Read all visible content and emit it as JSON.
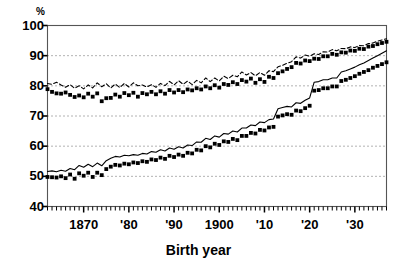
{
  "chart_data": {
    "type": "line",
    "title": "",
    "xlabel": "Birth year",
    "ylabel": "%",
    "ylim": [
      40,
      100
    ],
    "xlim": [
      1862,
      1937
    ],
    "grid": true,
    "legend": "none",
    "y_ticks": [
      100,
      90,
      80,
      70,
      60,
      50,
      40
    ],
    "y_tick_labels": [
      "100",
      "90",
      "80",
      "70",
      "60",
      "50",
      "40"
    ],
    "x_ticks": [
      1870,
      1880,
      1890,
      1900,
      1910,
      1920,
      1930
    ],
    "x_tick_labels": [
      "1870",
      "'80",
      "'90",
      "1900",
      "'10",
      "'20",
      "'30"
    ],
    "x_minor_tick_interval": 1,
    "series": [
      {
        "name": "upper-dashed-line",
        "style": "dashed",
        "color": "#000000",
        "x": [
          1862,
          1863,
          1864,
          1865,
          1866,
          1867,
          1868,
          1869,
          1870,
          1871,
          1872,
          1873,
          1874,
          1875,
          1876,
          1877,
          1878,
          1879,
          1880,
          1881,
          1882,
          1883,
          1884,
          1885,
          1886,
          1887,
          1888,
          1889,
          1890,
          1891,
          1892,
          1893,
          1894,
          1895,
          1896,
          1897,
          1898,
          1899,
          1900,
          1901,
          1902,
          1903,
          1904,
          1905,
          1906,
          1907,
          1908,
          1909,
          1910,
          1911,
          1912,
          1913,
          1914,
          1915,
          1916,
          1917,
          1918,
          1919,
          1920,
          1921,
          1922,
          1923,
          1924,
          1925,
          1926,
          1927,
          1928,
          1929,
          1930,
          1931,
          1932,
          1933,
          1934,
          1935,
          1936,
          1937
        ],
        "values": [
          80.8,
          80.5,
          81.2,
          80.3,
          79.5,
          80.4,
          79.2,
          80.0,
          79.0,
          80.3,
          79.3,
          81.0,
          79.7,
          80.7,
          79.3,
          80.6,
          79.4,
          80.8,
          79.6,
          81.0,
          80.0,
          80.3,
          79.6,
          80.4,
          79.5,
          80.8,
          80.1,
          81.5,
          80.3,
          81.7,
          80.5,
          81.6,
          80.4,
          81.8,
          81.0,
          82.6,
          81.4,
          82.6,
          81.6,
          83.2,
          82.4,
          83.5,
          83.0,
          84.6,
          83.6,
          84.4,
          83.3,
          84.4,
          83.5,
          85.0,
          84.7,
          86.3,
          86.8,
          87.5,
          88.0,
          89.6,
          89.2,
          90.2,
          89.8,
          90.6,
          90.4,
          91.3,
          91.2,
          92.0,
          91.6,
          92.4,
          92.3,
          92.9,
          92.7,
          93.4,
          93.3,
          94.0,
          94.2,
          94.8,
          95.2,
          95.6
        ]
      },
      {
        "name": "upper-square-markers",
        "style": "markers-squares",
        "color": "#000000",
        "x": [
          1862,
          1863,
          1864,
          1865,
          1866,
          1867,
          1868,
          1869,
          1870,
          1871,
          1872,
          1873,
          1874,
          1875,
          1876,
          1877,
          1878,
          1879,
          1880,
          1881,
          1882,
          1883,
          1884,
          1885,
          1886,
          1887,
          1888,
          1889,
          1890,
          1891,
          1892,
          1893,
          1894,
          1895,
          1896,
          1897,
          1898,
          1899,
          1900,
          1901,
          1902,
          1903,
          1904,
          1905,
          1906,
          1907,
          1908,
          1909,
          1910,
          1911,
          1912,
          1913,
          1914,
          1915,
          1916,
          1917,
          1918,
          1919,
          1920,
          1921,
          1922,
          1923,
          1924,
          1925,
          1926,
          1927,
          1928,
          1929,
          1930,
          1931,
          1932,
          1933,
          1934,
          1935,
          1936,
          1937
        ],
        "values": [
          78.9,
          78.0,
          77.5,
          77.4,
          77.8,
          77.0,
          76.3,
          76.8,
          76.2,
          77.4,
          76.4,
          77.5,
          74.9,
          75.9,
          76.0,
          77.1,
          76.4,
          77.6,
          76.9,
          77.7,
          76.4,
          77.6,
          77.2,
          78.0,
          77.2,
          78.2,
          77.4,
          78.6,
          77.8,
          78.6,
          77.9,
          78.8,
          78.5,
          79.2,
          78.8,
          79.8,
          79.2,
          80.2,
          79.4,
          80.6,
          80.3,
          81.2,
          80.6,
          81.9,
          81.4,
          82.4,
          81.0,
          82.2,
          81.3,
          83.0,
          82.6,
          84.2,
          84.8,
          85.6,
          86.2,
          87.6,
          87.4,
          88.4,
          88.2,
          89.0,
          88.9,
          89.8,
          89.8,
          90.6,
          90.3,
          91.1,
          91.0,
          91.7,
          91.6,
          92.3,
          92.2,
          93.0,
          93.2,
          93.8,
          94.2,
          94.6
        ]
      },
      {
        "name": "lower-solid-line",
        "style": "solid",
        "color": "#000000",
        "x": [
          1862,
          1863,
          1864,
          1865,
          1866,
          1867,
          1868,
          1869,
          1870,
          1871,
          1872,
          1873,
          1874,
          1875,
          1876,
          1877,
          1878,
          1879,
          1880,
          1881,
          1882,
          1883,
          1884,
          1885,
          1886,
          1887,
          1888,
          1889,
          1890,
          1891,
          1892,
          1893,
          1894,
          1895,
          1896,
          1897,
          1898,
          1899,
          1900,
          1901,
          1902,
          1903,
          1904,
          1905,
          1906,
          1907,
          1908,
          1909,
          1910,
          1911,
          1912,
          1913,
          1914,
          1915,
          1916,
          1917,
          1918,
          1919,
          1920,
          1921,
          1922,
          1923,
          1924,
          1925,
          1926,
          1927,
          1928,
          1929,
          1930,
          1931,
          1932,
          1933,
          1934,
          1935,
          1936,
          1937
        ],
        "values": [
          51.6,
          51.8,
          51.5,
          52.0,
          51.7,
          52.6,
          52.2,
          53.6,
          53.0,
          54.0,
          53.2,
          54.4,
          53.5,
          55.2,
          56.0,
          56.6,
          56.4,
          57.0,
          56.8,
          57.2,
          57.0,
          57.6,
          57.4,
          58.2,
          58.0,
          58.8,
          58.4,
          59.4,
          59.0,
          59.8,
          59.4,
          60.4,
          60.2,
          61.4,
          61.3,
          62.6,
          62.2,
          63.4,
          63.0,
          64.2,
          64.0,
          65.0,
          64.7,
          66.0,
          66.0,
          67.0,
          66.8,
          68.0,
          67.8,
          68.8,
          69.0,
          72.4,
          72.8,
          73.2,
          73.0,
          74.4,
          74.2,
          75.2,
          76.0,
          81.2,
          81.4,
          82.0,
          82.0,
          82.6,
          82.6,
          84.6,
          85.0,
          85.6,
          86.2,
          87.0,
          87.6,
          88.4,
          89.2,
          90.0,
          90.8,
          91.6
        ]
      },
      {
        "name": "lower-square-markers",
        "style": "markers-squares",
        "color": "#000000",
        "x": [
          1862,
          1863,
          1864,
          1865,
          1866,
          1867,
          1868,
          1869,
          1870,
          1871,
          1872,
          1873,
          1874,
          1875,
          1876,
          1877,
          1878,
          1879,
          1880,
          1881,
          1882,
          1883,
          1884,
          1885,
          1886,
          1887,
          1888,
          1889,
          1890,
          1891,
          1892,
          1893,
          1894,
          1895,
          1896,
          1897,
          1898,
          1899,
          1900,
          1901,
          1902,
          1903,
          1904,
          1905,
          1906,
          1907,
          1908,
          1909,
          1910,
          1911,
          1912,
          1913,
          1914,
          1915,
          1916,
          1917,
          1918,
          1919,
          1920,
          1921,
          1922,
          1923,
          1924,
          1925,
          1926,
          1927,
          1928,
          1929,
          1930,
          1931,
          1932,
          1933,
          1934,
          1935,
          1936,
          1937
        ],
        "values": [
          49.8,
          49.7,
          49.6,
          50.0,
          49.4,
          50.6,
          49.2,
          51.0,
          50.2,
          51.2,
          49.8,
          51.2,
          50.4,
          52.4,
          53.2,
          53.8,
          53.6,
          54.2,
          54.0,
          54.6,
          54.4,
          55.0,
          54.8,
          55.6,
          55.4,
          56.2,
          55.8,
          56.8,
          56.4,
          57.2,
          56.8,
          57.8,
          57.6,
          58.8,
          58.6,
          60.0,
          59.6,
          60.8,
          60.4,
          61.6,
          61.4,
          62.4,
          62.0,
          63.4,
          63.4,
          64.4,
          64.2,
          65.4,
          65.2,
          66.2,
          66.4,
          69.8,
          70.2,
          70.6,
          70.4,
          71.8,
          71.6,
          72.6,
          73.4,
          78.4,
          78.6,
          79.2,
          79.2,
          79.8,
          79.8,
          81.6,
          82.0,
          82.6,
          83.2,
          84.0,
          84.6,
          85.2,
          86.0,
          86.6,
          87.2,
          87.8
        ]
      }
    ]
  }
}
